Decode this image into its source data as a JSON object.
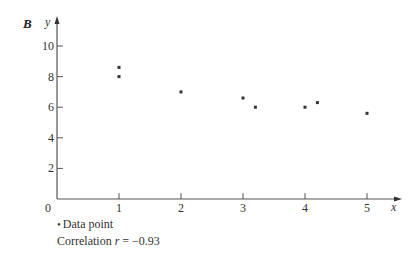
{
  "panel_label": "B",
  "legend": {
    "marker_symbol": "•",
    "marker_label": "Data point",
    "correlation_prefix": "Correlation",
    "correlation_var": "r",
    "correlation_eq": "= −0.93"
  },
  "colors": {
    "axis": "#555555",
    "point": "#333333",
    "text": "#333333"
  },
  "chart_data": {
    "type": "scatter",
    "title": "B",
    "xlabel": "x",
    "ylabel": "y",
    "xlim": [
      0,
      5.5
    ],
    "ylim": [
      0,
      11
    ],
    "x_ticks": [
      1,
      2,
      3,
      4,
      5
    ],
    "y_ticks": [
      2,
      4,
      6,
      8,
      10
    ],
    "origin_label": "0",
    "grid": false,
    "legend_position": "bottom-left",
    "series": [
      {
        "name": "Data point",
        "points": [
          {
            "x": 1.0,
            "y": 8.6
          },
          {
            "x": 1.0,
            "y": 8.0
          },
          {
            "x": 2.0,
            "y": 7.0
          },
          {
            "x": 3.0,
            "y": 6.6
          },
          {
            "x": 3.2,
            "y": 6.0
          },
          {
            "x": 4.0,
            "y": 6.0
          },
          {
            "x": 4.2,
            "y": 6.3
          },
          {
            "x": 5.0,
            "y": 5.6
          }
        ]
      }
    ],
    "annotations": [
      "Correlation r = −0.93"
    ]
  }
}
